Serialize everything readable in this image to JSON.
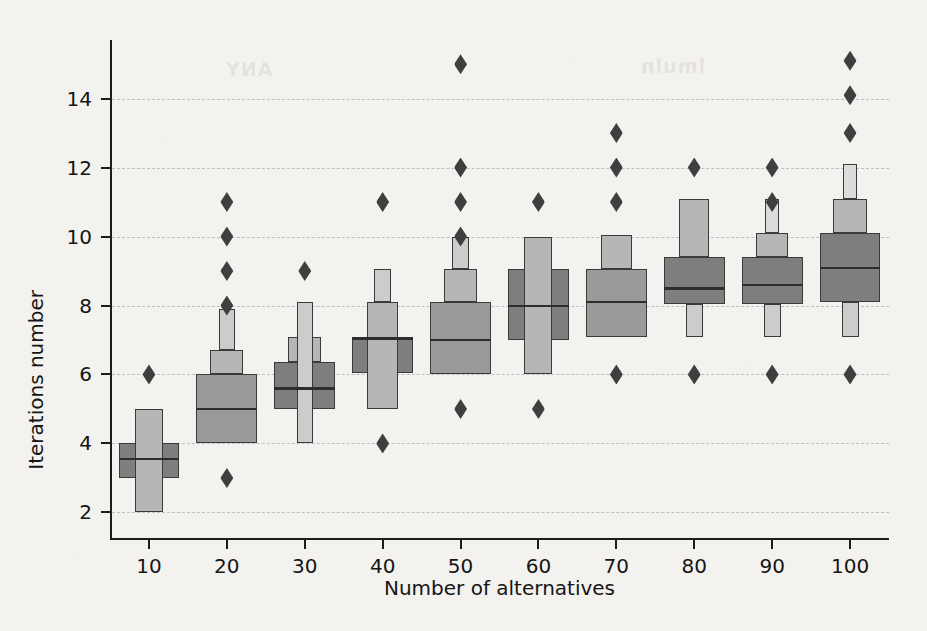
{
  "figure": {
    "background_color": "#f3f2ef",
    "ghost_text_left": "ANY",
    "ghost_text_right": "lmuln"
  },
  "chart_data": {
    "type": "boxenplot",
    "title": "",
    "xlabel": "Number of alternatives",
    "ylabel": "Iterations number",
    "categories": [
      "10",
      "20",
      "30",
      "40",
      "50",
      "60",
      "70",
      "80",
      "90",
      "100"
    ],
    "xticklabels": [
      "10",
      "20",
      "30",
      "40",
      "50",
      "60",
      "70",
      "80",
      "90",
      "100"
    ],
    "yticklabels": [
      "2",
      "4",
      "6",
      "8",
      "10",
      "12",
      "14"
    ],
    "ytickvalues": [
      2,
      4,
      6,
      8,
      10,
      12,
      14
    ],
    "ylim": [
      1.2,
      15.7
    ],
    "grid": "horizontal-dashed",
    "legend": "none",
    "box_colors": {
      "level_1": "#7e7e7e",
      "level_2": "#9a9a9a",
      "level_3": "#b6b6b6",
      "level_4": "#cccccc",
      "level_5": "#dcdcdc",
      "edge": "#3a3a3a",
      "median": "#2d2d2d",
      "outlier": "#3f3f3f"
    },
    "boxes": [
      {
        "category": "10",
        "median": 3.55,
        "levels": [
          {
            "low": 3.0,
            "high": 4.0,
            "width": 1.0,
            "shade": 1
          },
          {
            "low": 2.0,
            "high": 5.0,
            "width": 0.46,
            "shade": 3
          }
        ],
        "outliers": [
          6
        ]
      },
      {
        "category": "20",
        "median": 5.0,
        "levels": [
          {
            "low": 4.0,
            "high": 6.0,
            "width": 1.0,
            "shade": 2
          },
          {
            "low": 6.0,
            "high": 6.7,
            "width": 0.54,
            "shade": 3
          },
          {
            "low": 6.7,
            "high": 7.9,
            "width": 0.26,
            "shade": 4
          }
        ],
        "outliers": [
          3,
          8,
          9,
          10,
          11
        ]
      },
      {
        "category": "30",
        "median": 5.6,
        "levels": [
          {
            "low": 5.0,
            "high": 6.35,
            "width": 1.0,
            "shade": 1
          },
          {
            "low": 6.35,
            "high": 7.1,
            "width": 0.55,
            "shade": 3
          },
          {
            "low": 4.0,
            "high": 8.1,
            "width": 0.26,
            "shade": 4
          }
        ],
        "outliers": [
          9
        ]
      },
      {
        "category": "40",
        "median": 7.05,
        "levels": [
          {
            "low": 6.05,
            "high": 7.1,
            "width": 1.0,
            "shade": 1
          },
          {
            "low": 5.0,
            "high": 8.1,
            "width": 0.52,
            "shade": 3
          },
          {
            "low": 8.1,
            "high": 9.05,
            "width": 0.27,
            "shade": 4
          }
        ],
        "outliers": [
          4,
          11
        ]
      },
      {
        "category": "50",
        "median": 7.0,
        "levels": [
          {
            "low": 6.0,
            "high": 8.1,
            "width": 1.0,
            "shade": 2
          },
          {
            "low": 8.1,
            "high": 9.05,
            "width": 0.55,
            "shade": 3
          },
          {
            "low": 9.05,
            "high": 10.0,
            "width": 0.27,
            "shade": 4
          }
        ],
        "outliers": [
          5,
          10,
          11,
          12,
          15
        ]
      },
      {
        "category": "60",
        "median": 8.0,
        "levels": [
          {
            "low": 7.0,
            "high": 9.05,
            "width": 1.0,
            "shade": 1
          },
          {
            "low": 6.0,
            "high": 10.0,
            "width": 0.46,
            "shade": 3
          }
        ],
        "outliers": [
          5,
          11
        ]
      },
      {
        "category": "70",
        "median": 8.1,
        "levels": [
          {
            "low": 7.1,
            "high": 9.05,
            "width": 1.0,
            "shade": 2
          },
          {
            "low": 9.05,
            "high": 10.05,
            "width": 0.5,
            "shade": 3
          }
        ],
        "outliers": [
          6,
          11,
          12,
          13
        ]
      },
      {
        "category": "80",
        "median": 8.5,
        "levels": [
          {
            "low": 8.05,
            "high": 9.4,
            "width": 1.0,
            "shade": 1
          },
          {
            "low": 9.4,
            "high": 11.1,
            "width": 0.5,
            "shade": 3
          },
          {
            "low": 7.1,
            "high": 8.05,
            "width": 0.28,
            "shade": 4
          }
        ],
        "outliers": [
          6,
          12
        ]
      },
      {
        "category": "90",
        "median": 8.6,
        "levels": [
          {
            "low": 8.05,
            "high": 9.4,
            "width": 1.0,
            "shade": 1
          },
          {
            "low": 9.4,
            "high": 10.1,
            "width": 0.52,
            "shade": 3
          },
          {
            "low": 7.1,
            "high": 8.05,
            "width": 0.28,
            "shade": 4
          },
          {
            "low": 10.1,
            "high": 11.1,
            "width": 0.24,
            "shade": 5
          }
        ],
        "outliers": [
          6,
          11,
          12
        ]
      },
      {
        "category": "100",
        "median": 9.1,
        "levels": [
          {
            "low": 8.1,
            "high": 10.1,
            "width": 1.0,
            "shade": 1
          },
          {
            "low": 10.1,
            "high": 11.1,
            "width": 0.55,
            "shade": 3
          },
          {
            "low": 7.1,
            "high": 8.1,
            "width": 0.28,
            "shade": 4
          },
          {
            "low": 11.1,
            "high": 12.1,
            "width": 0.24,
            "shade": 5
          }
        ],
        "outliers": [
          6,
          13,
          14.1,
          15.1
        ]
      }
    ]
  }
}
